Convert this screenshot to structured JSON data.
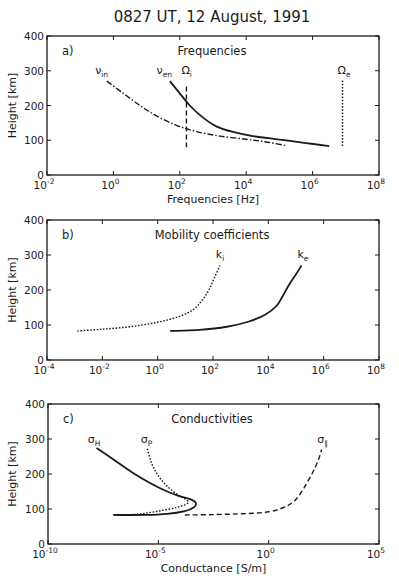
{
  "figure": {
    "title": "0827 UT, 12 August, 1991"
  },
  "chart_data": [
    {
      "id": "a",
      "type": "line",
      "panel_label": "a)",
      "title": "Frequencies",
      "xlabel": "Frequencies [Hz]",
      "ylabel": "Height [km]",
      "xscale": "log",
      "xlim_log10": [
        -2,
        8
      ],
      "ylim": [
        0,
        400
      ],
      "xticks": [
        "10^-2",
        "10^0",
        "10^2",
        "10^4",
        "10^6",
        "10^8"
      ],
      "yticks": [
        0,
        100,
        200,
        300,
        400
      ],
      "grid": false,
      "series": [
        {
          "name": "ν_in",
          "label_main": "ν",
          "label_sub": "in",
          "style": "dashdot",
          "points_log10x_h": [
            [
              -0.2,
              270
            ],
            [
              0.3,
              235
            ],
            [
              0.8,
              200
            ],
            [
              1.3,
              170
            ],
            [
              1.9,
              143
            ],
            [
              2.5,
              125
            ],
            [
              3.2,
              112
            ],
            [
              4.0,
              103
            ],
            [
              4.6,
              95
            ],
            [
              5.2,
              85
            ]
          ],
          "label_pos": [
            -0.55,
            290
          ]
        },
        {
          "name": "ν_en",
          "label_main": "ν",
          "label_sub": "en",
          "style": "solid",
          "points_log10x_h": [
            [
              1.7,
              270
            ],
            [
              2.0,
              235
            ],
            [
              2.3,
              200
            ],
            [
              2.7,
              165
            ],
            [
              3.1,
              140
            ],
            [
              3.6,
              124
            ],
            [
              4.2,
              112
            ],
            [
              5.0,
              102
            ],
            [
              5.8,
              92
            ],
            [
              6.5,
              83
            ]
          ],
          "label_pos": [
            1.3,
            290
          ]
        },
        {
          "name": "Ω_i",
          "label_main": "Ω",
          "label_sub": "i",
          "style": "dashed",
          "points_log10x_h": [
            [
              2.2,
              255
            ],
            [
              2.2,
              80
            ]
          ],
          "label_pos": [
            2.05,
            290
          ]
        },
        {
          "name": "Ω_e",
          "label_main": "Ω",
          "label_sub": "e",
          "style": "dotted",
          "points_log10x_h": [
            [
              6.9,
              272
            ],
            [
              6.9,
              80
            ]
          ],
          "label_pos": [
            6.75,
            290
          ]
        }
      ]
    },
    {
      "id": "b",
      "type": "line",
      "panel_label": "b)",
      "title": "Mobility coefficients",
      "xlabel": "",
      "ylabel": "Height [km]",
      "xscale": "log",
      "xlim_log10": [
        -4,
        8
      ],
      "ylim": [
        0,
        400
      ],
      "xticks": [
        "10^-4",
        "10^-2",
        "10^0",
        "10^2",
        "10^4",
        "10^6",
        "10^8"
      ],
      "yticks": [
        0,
        100,
        200,
        300,
        400
      ],
      "grid": false,
      "series": [
        {
          "name": "k_i",
          "label_main": "k",
          "label_sub": "i",
          "style": "dotted",
          "points_log10x_h": [
            [
              -2.9,
              83
            ],
            [
              -2.0,
              88
            ],
            [
              -1.0,
              95
            ],
            [
              0.0,
              108
            ],
            [
              0.8,
              125
            ],
            [
              1.3,
              145
            ],
            [
              1.6,
              170
            ],
            [
              1.85,
              200
            ],
            [
              2.05,
              235
            ],
            [
              2.25,
              270
            ]
          ],
          "label_pos": [
            2.1,
            292
          ]
        },
        {
          "name": "k_e",
          "label_main": "k",
          "label_sub": "e",
          "style": "solid",
          "points_log10x_h": [
            [
              0.45,
              83
            ],
            [
              1.5,
              86
            ],
            [
              2.5,
              95
            ],
            [
              3.3,
              110
            ],
            [
              3.9,
              130
            ],
            [
              4.3,
              155
            ],
            [
              4.5,
              180
            ],
            [
              4.75,
              215
            ],
            [
              5.0,
              245
            ],
            [
              5.2,
              270
            ]
          ],
          "label_pos": [
            5.05,
            292
          ]
        }
      ]
    },
    {
      "id": "c",
      "type": "line",
      "panel_label": "c)",
      "title": "Conductivities",
      "xlabel": "Conductance [S/m]",
      "ylabel": "Height [km]",
      "xscale": "log",
      "xlim_log10": [
        -10,
        5
      ],
      "ylim": [
        0,
        400
      ],
      "xticks": [
        "10^-10",
        "10^-5",
        "10^0",
        "10^5"
      ],
      "yticks": [
        0,
        100,
        200,
        300,
        400
      ],
      "grid": false,
      "series": [
        {
          "name": "σ_H",
          "label_main": "σ",
          "label_sub": "H",
          "style": "solid",
          "points_log10x_h": [
            [
              -7.8,
              274
            ],
            [
              -7.0,
              240
            ],
            [
              -6.2,
              205
            ],
            [
              -5.4,
              175
            ],
            [
              -4.6,
              150
            ],
            [
              -4.0,
              136
            ],
            [
              -3.5,
              127
            ],
            [
              -3.3,
              117
            ],
            [
              -3.4,
              104
            ],
            [
              -3.8,
              94
            ],
            [
              -4.6,
              86
            ],
            [
              -5.6,
              83
            ],
            [
              -7.05,
              83
            ]
          ],
          "label_pos": [
            -8.2,
            290
          ]
        },
        {
          "name": "σ_P",
          "label_main": "σ",
          "label_sub": "P",
          "style": "dotted",
          "points_log10x_h": [
            [
              -5.5,
              272
            ],
            [
              -5.3,
              230
            ],
            [
              -5.0,
              195
            ],
            [
              -4.6,
              165
            ],
            [
              -4.1,
              140
            ],
            [
              -3.7,
              125
            ],
            [
              -3.7,
              115
            ],
            [
              -4.2,
              104
            ],
            [
              -5.0,
              94
            ],
            [
              -5.8,
              86
            ],
            [
              -6.5,
              83
            ]
          ],
          "label_pos": [
            -5.8,
            290
          ]
        },
        {
          "name": "σ_∥",
          "label_main": "σ",
          "label_sub": "∥",
          "style": "dashed",
          "points_log10x_h": [
            [
              -3.8,
              83
            ],
            [
              -2.5,
              84
            ],
            [
              -1.0,
              87
            ],
            [
              0.0,
              92
            ],
            [
              0.7,
              105
            ],
            [
              1.2,
              125
            ],
            [
              1.6,
              160
            ],
            [
              2.0,
              205
            ],
            [
              2.25,
              240
            ],
            [
              2.4,
              270
            ]
          ],
          "label_pos": [
            2.2,
            290
          ]
        }
      ]
    }
  ],
  "layout_px": {
    "panels": {
      "a": {
        "left": 47,
        "right": 379,
        "top": 36,
        "bottom": 175
      },
      "b": {
        "left": 47,
        "right": 379,
        "top": 220,
        "bottom": 360
      },
      "c": {
        "left": 48,
        "right": 379,
        "top": 404,
        "bottom": 544
      }
    }
  }
}
